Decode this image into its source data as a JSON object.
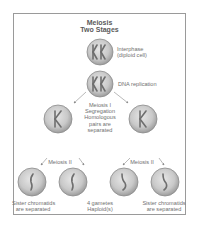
{
  "title": {
    "line1": "Meiosis",
    "line2": "Two Stages"
  },
  "stages": [
    {
      "id": "interphase",
      "label_line1": "Interphase",
      "label_line2": "(diploid cell)",
      "chromosomes": "two replicated pairs (KK)"
    },
    {
      "id": "dna-replication",
      "label_line1": "DNA replication",
      "chromosomes": "two replicated pairs (KK)"
    },
    {
      "id": "meiosis-1",
      "label_lines": [
        "Meiosis I",
        "Segregation",
        "Homologous",
        "pairs are",
        "separated"
      ],
      "chromosomes": "one replicated chromosome (K) per cell"
    },
    {
      "id": "meiosis-2",
      "label": "Meiosis II",
      "chromosomes": "single chromatid per cell"
    }
  ],
  "meiosis2_left_label": "Meiosis II",
  "meiosis2_right_label": "Meiosis II",
  "bottom_labels": {
    "left_line1": "Sister chromatids",
    "left_line2": "are separated",
    "center_line1": "4 gametes",
    "center_line2": "Haploid(s)",
    "right_line1": "Sister chromatids",
    "right_line2": "are separated"
  },
  "colors": {
    "cell_fill": "#c9c9c9",
    "cell_edge": "#8c8c8c",
    "chromosome": "#6e6e6e",
    "arrow": "#8a8a8a",
    "frame": "#9a9a9a",
    "text": "#6a6a6a"
  }
}
